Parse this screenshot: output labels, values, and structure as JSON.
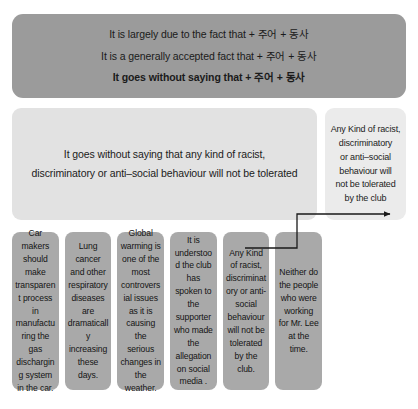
{
  "pattern_box": {
    "lines": [
      {
        "text": "It is largely due to the fact that + 주어 + 동사",
        "emphasis": false
      },
      {
        "text": "It is a generally accepted fact that + 주어 + 동사",
        "emphasis": false
      },
      {
        "text": "It goes without saying that + 주어 + 동사",
        "emphasis": true
      }
    ],
    "color": "#9b9b9b"
  },
  "sentence_box": {
    "lines": [
      "It goes without saying that any kind of racist,",
      "discriminatory or anti–social behaviour will not be tolerated"
    ],
    "color": "#e2e2e2"
  },
  "result_box": {
    "lines": [
      "Any Kind of racist,",
      "discriminatory",
      "or anti–social",
      "behaviour will",
      "not be tolerated",
      "by the club"
    ],
    "color": "#ebebeb"
  },
  "bottom_items": [
    {
      "text": "Car makers should make transparent process in manufacturing the gas discharging system in the car."
    },
    {
      "text": "Lung cancer and other respiratory diseases are dramatically increasing these days."
    },
    {
      "text": "Global warming is one of the most controversial issues as it is causing the serious changes in the weather."
    },
    {
      "text": "It is understood the club has spoken to the supporter who made the allegation on social media ."
    },
    {
      "text": "Any Kind of racist, discriminatory or anti-social behaviour will not be tolerated by the club."
    },
    {
      "text": "Neither do the people who were working for Mr. Lee at the time."
    }
  ],
  "bottom_color": "#a9a9a9",
  "connector": {
    "stroke": "#1a1a1a",
    "description": "elbow-arrow-from-item-5-to-result-box"
  }
}
